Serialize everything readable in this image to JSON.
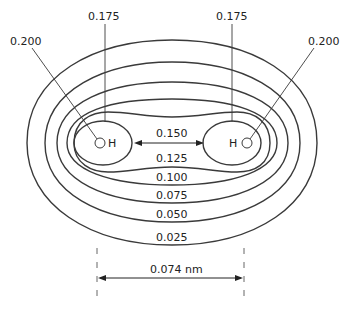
{
  "diagram": {
    "atoms": [
      {
        "symbol": "H",
        "x": 100,
        "y": 143
      },
      {
        "symbol": "H",
        "x": 245,
        "y": 143
      }
    ],
    "contour_levels": [
      "0.025",
      "0.050",
      "0.075",
      "0.100",
      "0.125",
      "0.150",
      "0.175",
      "0.200"
    ],
    "labels": {
      "c025": "0.025",
      "c050": "0.050",
      "c075": "0.075",
      "c100": "0.100",
      "c125": "0.125",
      "c150": "0.150",
      "c175_left": "0.175",
      "c175_right": "0.175",
      "c200_left": "0.200",
      "c200_right": "0.200"
    },
    "bond_length_label": "0.074 nm",
    "colors": {
      "line": "#3a3a3a",
      "text": "#222222",
      "background": "#ffffff"
    }
  }
}
